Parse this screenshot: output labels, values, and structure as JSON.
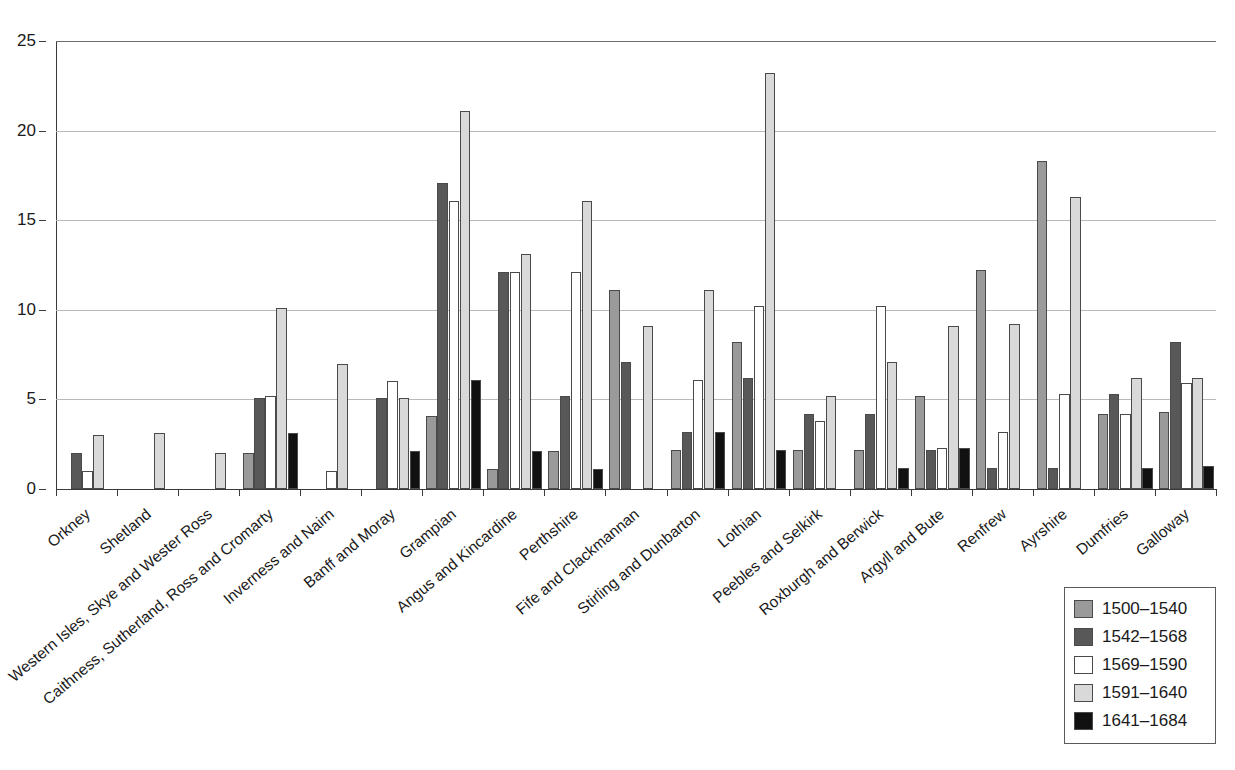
{
  "chart_data": {
    "type": "bar",
    "title": "",
    "xlabel": "",
    "ylabel": "",
    "ylim": [
      0,
      25
    ],
    "yticks": [
      0,
      5,
      10,
      15,
      20,
      25
    ],
    "grid": true,
    "legend_position": "bottom-right",
    "categories": [
      "Orkney",
      "Shetland",
      "Western Isles, Skye and Wester Ross",
      "Caithness, Sutherland, Ross and Cromarty",
      "Inverness and Nairn",
      "Banff and Moray",
      "Grampian",
      "Angus and Kincardine",
      "Perthshire",
      "Fife and Clackmannan",
      "Stirling and Dunbarton",
      "Lothian",
      "Peebles and Selkirk",
      "Roxburgh and Berwick",
      "Argyll and Bute",
      "Renfrew",
      "Ayrshire",
      "Dumfries",
      "Galloway"
    ],
    "series": [
      {
        "name": "1500–1540",
        "color": "#9a9a9a",
        "values": [
          0,
          0,
          0,
          2.0,
          0,
          0,
          4.1,
          1.1,
          2.1,
          11.1,
          2.2,
          8.2,
          2.2,
          2.2,
          5.2,
          12.2,
          18.3,
          4.2,
          4.3
        ]
      },
      {
        "name": "1542–1568",
        "color": "#585858",
        "values": [
          2.0,
          0,
          0,
          5.1,
          0,
          5.1,
          17.1,
          12.1,
          5.2,
          7.1,
          3.2,
          6.2,
          4.2,
          4.2,
          2.2,
          1.2,
          1.2,
          5.3,
          8.2
        ]
      },
      {
        "name": "1569–1590",
        "color": "#ffffff",
        "values": [
          1.0,
          0,
          0,
          5.2,
          1.0,
          6.0,
          16.1,
          12.1,
          12.1,
          0,
          6.1,
          10.2,
          3.8,
          10.2,
          2.3,
          3.2,
          5.3,
          4.2,
          5.9
        ]
      },
      {
        "name": "1591–1640",
        "color": "#d9d9d9",
        "values": [
          3.0,
          3.1,
          2.0,
          10.1,
          7.0,
          5.1,
          21.1,
          13.1,
          16.1,
          9.1,
          11.1,
          23.2,
          5.2,
          7.1,
          9.1,
          9.2,
          16.3,
          6.2,
          6.2
        ]
      },
      {
        "name": "1641–1684",
        "color": "#111111",
        "values": [
          0,
          0,
          0,
          3.1,
          0,
          2.1,
          6.1,
          2.1,
          1.1,
          0,
          3.2,
          2.2,
          0,
          1.2,
          2.3,
          0,
          0,
          1.2,
          1.3
        ]
      }
    ]
  },
  "legend": {
    "items": [
      {
        "label": "1500–1540",
        "color": "#9a9a9a"
      },
      {
        "label": "1542–1568",
        "color": "#585858"
      },
      {
        "label": "1569–1590",
        "color": "#ffffff"
      },
      {
        "label": "1591–1640",
        "color": "#d9d9d9"
      },
      {
        "label": "1641–1684",
        "color": "#111111"
      }
    ]
  }
}
